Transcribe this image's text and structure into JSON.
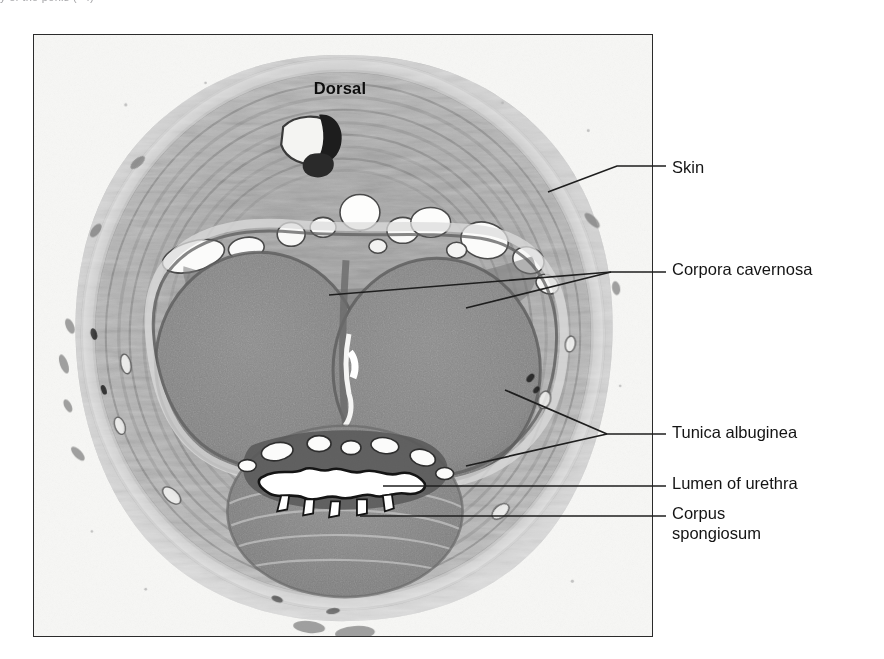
{
  "figure": {
    "caption_fragment": "y  of  the  penis  (×4)",
    "orientation": {
      "dorsal": "Dorsal",
      "ventral": "Ventral"
    },
    "frame_color": "#2b2b2b",
    "background_color": "#ffffff",
    "plate_background": "#f6f6f4"
  },
  "labels": [
    {
      "id": "skin",
      "text": "Skin",
      "leader": "diagonal-elbow"
    },
    {
      "id": "corpora",
      "text": "Corpora cavernosa",
      "leader": "double-converging"
    },
    {
      "id": "tunica",
      "text": "Tunica albuginea",
      "leader": "double-converging-v"
    },
    {
      "id": "lumen",
      "text": "Lumen of urethra",
      "leader": "horizontal"
    },
    {
      "id": "spongiosum",
      "text": "Corpus\nspongiosum",
      "leader": "horizontal"
    }
  ],
  "specimen": {
    "type": "light-micrograph",
    "stain": "grayscale",
    "structures": [
      "skin",
      "dartos / dense connective tissue",
      "dorsal vein",
      "dorsal arteries",
      "corpora cavernosa (paired)",
      "tunica albuginea",
      "corpus spongiosum",
      "urethral lumen"
    ]
  }
}
